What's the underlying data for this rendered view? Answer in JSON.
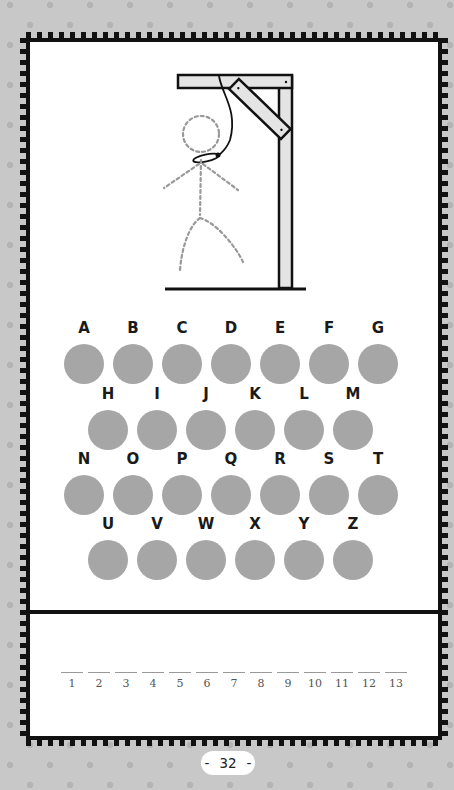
{
  "puzzle": {
    "type": "hangman",
    "figure": {
      "gallows": "gallows-drawing",
      "stick_figure_state": "dashed-outline",
      "noose": true
    },
    "alphabet_rows": [
      [
        "A",
        "B",
        "C",
        "D",
        "E",
        "F",
        "G"
      ],
      [
        "H",
        "I",
        "J",
        "K",
        "L",
        "M"
      ],
      [
        "N",
        "O",
        "P",
        "Q",
        "R",
        "S",
        "T"
      ],
      [
        "U",
        "V",
        "W",
        "X",
        "Y",
        "Z"
      ]
    ],
    "answer_blank_count": 13,
    "answer_numbers": [
      "1",
      "2",
      "3",
      "4",
      "5",
      "6",
      "7",
      "8",
      "9",
      "10",
      "11",
      "12",
      "13"
    ]
  },
  "colors": {
    "background": "#c8c8c8",
    "dots": "#b4b4b4",
    "frame": "#111111",
    "letter_circle": "#a6a6a6",
    "figure_dashes": "#999999",
    "gallows_fill": "#e4e4e4"
  },
  "page": {
    "number_label": "- 32 -"
  }
}
